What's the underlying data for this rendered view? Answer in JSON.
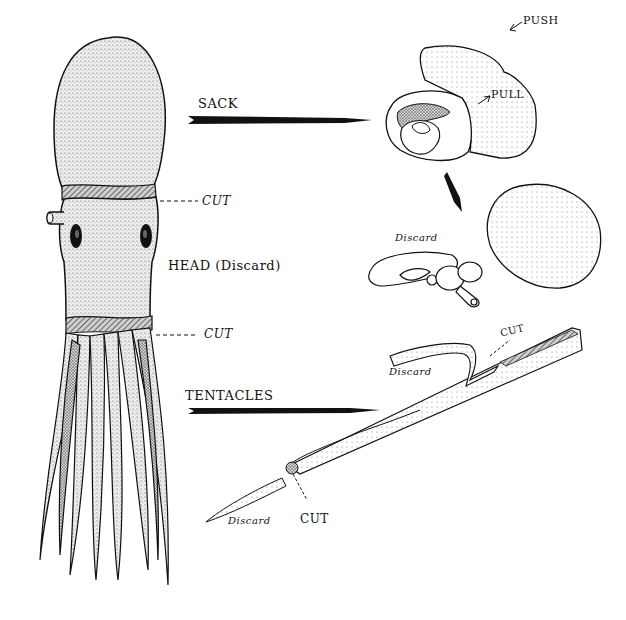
{
  "diagram": {
    "colors": {
      "ink": "#111111",
      "stipple": "#9a9a9a",
      "body_fill": "#e6e6e6",
      "background": "#ffffff"
    },
    "labels": {
      "sack": "SACK",
      "push": "PUSH",
      "pull": "PULL",
      "cut_upper": "CUT",
      "head": "HEAD (Discard)",
      "cut_lower": "CUT",
      "tentacles": "TENTACLES",
      "discard_innards": "Discard",
      "discard_tentacle_tip": "Discard",
      "cut_tentacle_tip": "CUT",
      "discard_tentacle_base": "Discard",
      "cut_tentacle_base": "CUT"
    },
    "parts": [
      {
        "id": "mantle-sack",
        "label_key": "sack",
        "arrow_to": "sack-inversion"
      },
      {
        "id": "head",
        "label_key": "head"
      },
      {
        "id": "tentacles",
        "label_key": "tentacles",
        "arrow_to": "tentacle-strip"
      }
    ]
  }
}
